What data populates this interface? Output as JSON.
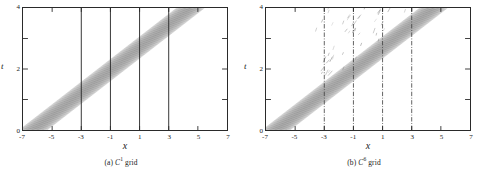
{
  "figure": {
    "panels": [
      {
        "id": "panel-a",
        "caption_prefix": "(a)",
        "caption_symbol": "C",
        "caption_superscript": "1",
        "caption_suffix": "grid",
        "caption_full": "(a) C1 grid",
        "xlabel": "x",
        "ylabel": "t",
        "interface_line_style": "solid"
      },
      {
        "id": "panel-b",
        "caption_prefix": "(b)",
        "caption_symbol": "C",
        "caption_superscript": "6",
        "caption_suffix": "grid",
        "caption_full": "(b) C6 grid",
        "xlabel": "x",
        "ylabel": "t",
        "interface_line_style": "dash-dot"
      }
    ]
  },
  "chart_data": [
    {
      "type": "line",
      "title": "(a) C1 grid",
      "xlabel": "x",
      "ylabel": "t",
      "xlim": [
        -7,
        7
      ],
      "ylim": [
        0,
        4
      ],
      "xticks": [
        -7,
        -5,
        -3,
        -1,
        1,
        3,
        5,
        7
      ],
      "xticklabels": [
        "-7",
        "-5",
        "-3",
        "-1",
        "1",
        "3",
        "5",
        "7"
      ],
      "yticks": [
        0,
        1,
        2,
        3,
        4
      ],
      "yticklabels": [
        "0",
        "",
        "2",
        "",
        "4"
      ],
      "grid": false,
      "legend": null,
      "description": "Space-time (x-t) contour plot of a propagating wave packet; a dense bundle of parallel characteristic contour lines forms a straight diagonal band.",
      "band": {
        "type": "parallel-contour-band",
        "n_contours": 34,
        "slope_t_per_x": 0.37,
        "x_at_t0_center": -6.3,
        "x_at_t4_center": 4.5,
        "half_width_x": 0.95,
        "color": "#6a6a6a"
      },
      "interfaces": {
        "x_positions": [
          -3,
          -1,
          1,
          3
        ],
        "style": "solid",
        "color": "#2b2b2b",
        "t_range": [
          0,
          4
        ]
      },
      "artifacts": []
    },
    {
      "type": "line",
      "title": "(b) C6 grid",
      "xlabel": "x",
      "ylabel": "t",
      "xlim": [
        -7,
        7
      ],
      "ylim": [
        0,
        4
      ],
      "xticks": [
        -7,
        -5,
        -3,
        -1,
        1,
        3,
        5,
        7
      ],
      "xticklabels": [
        "-7",
        "-5",
        "-3",
        "-1",
        "1",
        "3",
        "5",
        "7"
      ],
      "yticks": [
        0,
        1,
        2,
        3,
        4
      ],
      "yticklabels": [
        "0",
        "",
        "2",
        "",
        "4"
      ],
      "grid": false,
      "legend": null,
      "description": "Same x-t contour plot on a C6 grid; the main diagonal band is accompanied by scattered spurious reflected contour fragments above and to the left of the band near the grid interfaces.",
      "band": {
        "type": "parallel-contour-band",
        "n_contours": 34,
        "slope_t_per_x": 0.37,
        "x_at_t0_center": -6.3,
        "x_at_t4_center": 4.5,
        "half_width_x": 0.95,
        "color": "#6a6a6a"
      },
      "interfaces": {
        "x_positions": [
          -3,
          -1,
          1,
          3
        ],
        "style": "dash-dot",
        "color": "#3a3a3a",
        "t_range": [
          0,
          4
        ]
      },
      "artifacts": {
        "type": "spurious-reflected-contour-fragments",
        "region": "above the main band",
        "count": 46,
        "color": "#7a7a7a"
      }
    }
  ]
}
